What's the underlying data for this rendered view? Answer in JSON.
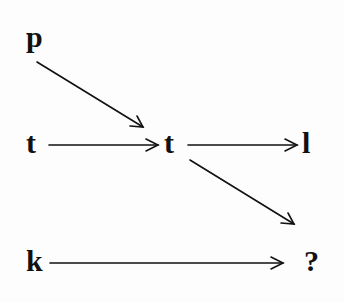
{
  "diagram": {
    "type": "analogy-arrow-diagram",
    "nodes": [
      {
        "id": "p",
        "label": "p",
        "x": 26,
        "y": 26
      },
      {
        "id": "t1",
        "label": "t",
        "x": 26,
        "y": 130
      },
      {
        "id": "t2",
        "label": "t",
        "x": 164,
        "y": 130
      },
      {
        "id": "l",
        "label": "l",
        "x": 302,
        "y": 130
      },
      {
        "id": "k",
        "label": "k",
        "x": 26,
        "y": 248
      },
      {
        "id": "q",
        "label": "?",
        "x": 304,
        "y": 248
      }
    ],
    "edges": [
      {
        "from": "p",
        "to": "t2",
        "x1": 37,
        "y1": 62,
        "x2": 143,
        "y2": 127
      },
      {
        "from": "t1",
        "to": "t2",
        "x1": 49,
        "y1": 145,
        "x2": 158,
        "y2": 145
      },
      {
        "from": "t2",
        "to": "l",
        "x1": 188,
        "y1": 145,
        "x2": 297,
        "y2": 145
      },
      {
        "from": "t2",
        "to": "q",
        "x1": 190,
        "y1": 160,
        "x2": 294,
        "y2": 224
      },
      {
        "from": "k",
        "to": "q",
        "x1": 50,
        "y1": 263,
        "x2": 283,
        "y2": 263
      }
    ],
    "colors": {
      "ink": "#111111",
      "background": "#fdfdfd"
    }
  }
}
